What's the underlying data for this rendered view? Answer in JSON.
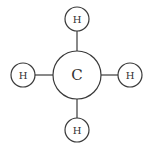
{
  "diagram": {
    "central_atom": {
      "symbol": "C"
    },
    "substituents": [
      {
        "position": "top",
        "symbol": "H"
      },
      {
        "position": "left",
        "symbol": "H"
      },
      {
        "position": "right",
        "symbol": "H"
      },
      {
        "position": "bottom",
        "symbol": "H"
      }
    ],
    "bonds": [
      {
        "from": "C",
        "to": "top-H",
        "type": "single"
      },
      {
        "from": "C",
        "to": "left-H",
        "type": "single"
      },
      {
        "from": "C",
        "to": "right-H",
        "type": "single"
      },
      {
        "from": "C",
        "to": "bottom-H",
        "type": "single"
      }
    ],
    "colors": {
      "line": "#3a3a3a",
      "text": "#333333",
      "background": "#ffffff"
    }
  }
}
